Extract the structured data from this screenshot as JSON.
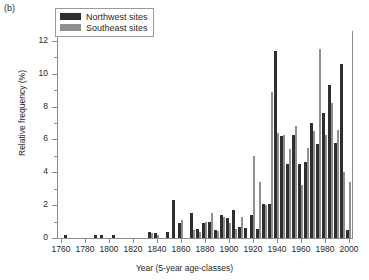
{
  "panel_label": "(b)",
  "legend": {
    "position": "top-left",
    "entries": [
      {
        "label": "Northwest sites",
        "color": "#2e2e2e",
        "key": "northwest"
      },
      {
        "label": "Southeast sites",
        "color": "#8f8f8f",
        "key": "southeast"
      }
    ]
  },
  "axes": {
    "y_ticklabels": [
      "0",
      "2",
      "4",
      "6",
      "8",
      "10",
      "12"
    ],
    "x_ticklabels": [
      "1760",
      "1780",
      "1800",
      "1820",
      "1840",
      "1860",
      "1880",
      "1900",
      "1920",
      "1940",
      "1960",
      "1980",
      "2000"
    ]
  },
  "chart_data": {
    "type": "bar",
    "title": "",
    "xlabel": "Year (5-year age-classes)",
    "ylabel": "Relative frequency (%)",
    "xlim": [
      1757.5,
      2002.5
    ],
    "ylim": [
      0,
      12.6
    ],
    "yticks": [
      0,
      2,
      4,
      6,
      8,
      10,
      12
    ],
    "xticks": [
      1760,
      1780,
      1800,
      1820,
      1840,
      1860,
      1880,
      1900,
      1920,
      1940,
      1960,
      1980,
      2000
    ],
    "grid": false,
    "bar_group_width_years": 5,
    "categories": [
      1760,
      1765,
      1770,
      1775,
      1780,
      1785,
      1790,
      1795,
      1800,
      1805,
      1810,
      1815,
      1820,
      1825,
      1830,
      1835,
      1840,
      1845,
      1850,
      1855,
      1860,
      1865,
      1870,
      1875,
      1880,
      1885,
      1890,
      1895,
      1900,
      1905,
      1910,
      1915,
      1920,
      1925,
      1930,
      1935,
      1940,
      1945,
      1950,
      1955,
      1960,
      1965,
      1970,
      1975,
      1980,
      1985,
      1990,
      1995,
      2000
    ],
    "series": [
      {
        "name": "Northwest sites",
        "color": "#2e2e2e",
        "values": [
          0,
          0.2,
          0,
          0,
          0,
          0,
          0.2,
          0.2,
          0,
          0.2,
          0,
          0,
          0,
          0,
          0,
          0.35,
          0.3,
          0,
          0.35,
          2.3,
          0.9,
          0,
          1.5,
          0.55,
          0.9,
          1.0,
          0.5,
          1.4,
          1.2,
          1.7,
          0.7,
          0.6,
          1.4,
          0.55,
          2.1,
          2.1,
          11.4,
          6.2,
          4.5,
          6.3,
          4.5,
          4.6,
          7.0,
          5.7,
          7.6,
          9.3,
          5.8,
          10.6,
          0.5
        ]
      },
      {
        "name": "Southeast sites",
        "color": "#8f8f8f",
        "values": [
          0,
          0,
          0,
          0,
          0,
          0,
          0,
          0,
          0,
          0,
          0,
          0,
          0,
          0,
          0,
          0.3,
          0.2,
          0,
          0,
          0,
          1.1,
          0,
          0.5,
          0.35,
          1.0,
          1.55,
          0.45,
          1.25,
          0.9,
          0.55,
          1.3,
          0,
          5.0,
          3.4,
          2.0,
          8.9,
          6.4,
          6.3,
          5.4,
          6.8,
          3.2,
          5.5,
          6.5,
          11.5,
          6.3,
          8.2,
          6.6,
          4.0,
          3.4
        ]
      }
    ]
  }
}
